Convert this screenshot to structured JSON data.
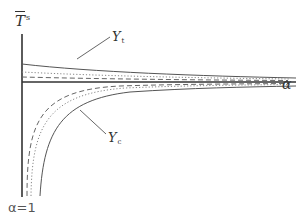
{
  "diagram": {
    "y_axis_label": {
      "main": "T",
      "superscript": "s",
      "overline": true
    },
    "x_axis_label": "α",
    "origin_label": "α=1",
    "curve_labels": {
      "upper": {
        "main": "Y",
        "subscript": "t"
      },
      "lower": {
        "main": "Y",
        "subscript": "c"
      }
    },
    "line_styles": [
      "solid",
      "dotted",
      "dashed"
    ],
    "colors": {
      "axis": "#333333",
      "solid": "#555555",
      "dotted": "#888888",
      "dashed": "#666666"
    }
  }
}
